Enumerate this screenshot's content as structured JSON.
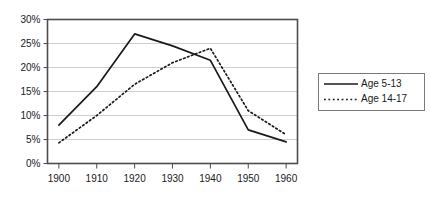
{
  "chart_data": {
    "type": "line",
    "title": "",
    "subtitle": "",
    "xlabel": "",
    "ylabel": "",
    "x": [
      1900,
      1910,
      1920,
      1930,
      1940,
      1950,
      1960
    ],
    "categories": [
      "1900",
      "1910",
      "1920",
      "1930",
      "1940",
      "1950",
      "1960"
    ],
    "series": [
      {
        "name": "Age 5-13",
        "style": "solid",
        "color": "#1a1a1a",
        "values": [
          8.0,
          16.0,
          27.0,
          24.5,
          21.5,
          7.0,
          4.5
        ]
      },
      {
        "name": "Age 14-17",
        "style": "dotted",
        "color": "#1a1a1a",
        "values": [
          4.3,
          10.0,
          16.5,
          21.0,
          24.0,
          11.0,
          6.0
        ]
      }
    ],
    "xlim": [
      1897,
      1963
    ],
    "ylim": [
      0,
      30
    ],
    "y_ticks": [
      0,
      5,
      10,
      15,
      20,
      25,
      30
    ],
    "y_tick_labels": [
      "0%",
      "5%",
      "10%",
      "15%",
      "20%",
      "25%",
      "30%"
    ],
    "x_ticks": [
      1900,
      1910,
      1920,
      1930,
      1940,
      1950,
      1960
    ],
    "x_tick_labels": [
      "1900",
      "1910",
      "1920",
      "1930",
      "1940",
      "1950",
      "1960"
    ],
    "grid": {
      "horizontal": true,
      "vertical": false,
      "color": "#c8c8c8"
    },
    "legend": {
      "position": "right",
      "entries": [
        {
          "label": "Age 5-13",
          "style": "solid"
        },
        {
          "label": "Age 14-17",
          "style": "dotted"
        }
      ]
    },
    "axis_color": "#4d4d4d",
    "background": "#ffffff"
  }
}
